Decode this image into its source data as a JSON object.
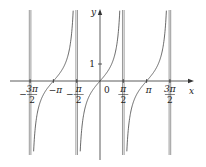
{
  "chart_data": {
    "type": "line",
    "title": "",
    "function": "y = tan x",
    "xlabel": "x",
    "ylabel": "y",
    "origin_label": "0",
    "xlim": [
      -5.0,
      5.8
    ],
    "ylim": [
      -4.4,
      4.1
    ],
    "grid": false,
    "x_ticks": [
      {
        "value": -4.712389,
        "num": "3π",
        "den": "2",
        "sign": "−"
      },
      {
        "value": -3.141593,
        "text": "−π"
      },
      {
        "value": -1.570796,
        "num": "π",
        "den": "2",
        "sign": "−"
      },
      {
        "value": 1.570796,
        "num": "π",
        "den": "2",
        "sign": ""
      },
      {
        "value": 3.141593,
        "text": "π"
      },
      {
        "value": 4.712389,
        "num": "3π",
        "den": "2",
        "sign": ""
      }
    ],
    "y_ticks": [
      {
        "value": 1,
        "text": "1"
      }
    ],
    "asymptotes_x": [
      -4.712389,
      -1.570796,
      1.570796,
      4.712389
    ],
    "series": [
      {
        "name": "tan x",
        "branch_centers": [
          -3.141593,
          0,
          3.141593
        ]
      }
    ],
    "sample_points": [
      {
        "x": -0.785398,
        "y": -1
      },
      {
        "x": 0,
        "y": 0
      },
      {
        "x": 0.785398,
        "y": 1
      },
      {
        "x": 3.141593,
        "y": 0
      },
      {
        "x": -3.141593,
        "y": 0
      }
    ]
  },
  "colors": {
    "axis": "#333333",
    "curve": "#444444",
    "asymptote": "#555555",
    "background": "#ffffff"
  }
}
